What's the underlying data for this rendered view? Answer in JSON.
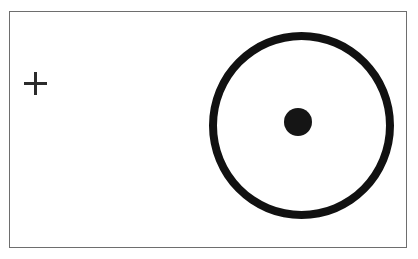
{
  "figure": {
    "title": "",
    "background_color": "#ffffff",
    "frame": {
      "name": "figure-frame",
      "border_color": "#6e6e6e",
      "border_width_px": 1,
      "x": 9,
      "y": 11,
      "width": 398,
      "height": 237
    },
    "shapes": [
      {
        "id": "plus-marker",
        "kind": "cross",
        "label": "plus-marker",
        "color": "#2b2b2b",
        "center_x": 34,
        "center_y": 82,
        "size": 23,
        "stroke_width_px": 3
      },
      {
        "id": "ring",
        "kind": "circle-outline",
        "label": "large-ring",
        "color": "#111111",
        "center_x": 300,
        "center_y": 124,
        "outer_diameter": 185,
        "stroke_width_px": 8
      },
      {
        "id": "center-dot",
        "kind": "circle-filled",
        "label": "center-dot",
        "color": "#151515",
        "center_x": 297,
        "center_y": 121,
        "diameter": 28
      }
    ]
  },
  "colors": {
    "ink": "#111111",
    "marker": "#2b2b2b",
    "frame_line": "#6e6e6e",
    "page": "#ffffff"
  }
}
